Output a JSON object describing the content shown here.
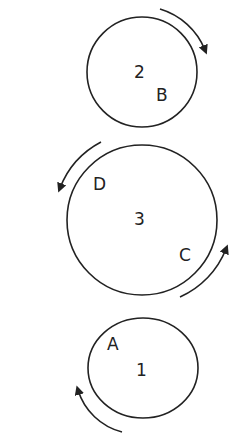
{
  "diagram": {
    "type": "rotating circles",
    "stroke_color": "#222222",
    "background": "#ffffff",
    "circles": [
      {
        "id": "circle-2",
        "number": "2",
        "letters": [
          "B"
        ],
        "rotation": "clockwise"
      },
      {
        "id": "circle-3",
        "number": "3",
        "letters": [
          "D",
          "C"
        ],
        "rotation": "counterclockwise"
      },
      {
        "id": "circle-1",
        "number": "1",
        "letters": [
          "A"
        ],
        "rotation": "clockwise"
      }
    ]
  },
  "labels": {
    "c2_number": "2",
    "c2_letter": "B",
    "c3_number": "3",
    "c3_letter_d": "D",
    "c3_letter_c": "C",
    "c1_number": "1",
    "c1_letter": "A"
  }
}
